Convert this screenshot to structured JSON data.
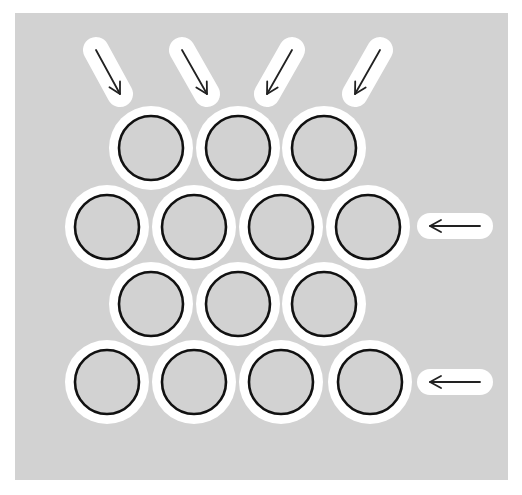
{
  "diagram": {
    "title": "",
    "colors": {
      "page": "#ffffff",
      "panel": "#d2d2d2",
      "halo": "#ffffff",
      "circle_fill": "#d2d2d2",
      "circle_stroke": "#111111",
      "arrow": "#222222"
    },
    "panel": {
      "x": 15,
      "y": 13,
      "w": 493,
      "h": 467
    },
    "circle": {
      "inner_r": 32,
      "halo_r": 42,
      "stroke_w": 2.6
    },
    "rows": [
      {
        "y": 148,
        "xs": [
          151,
          238,
          324
        ]
      },
      {
        "y": 227,
        "xs": [
          107,
          194,
          281,
          368
        ]
      },
      {
        "y": 304,
        "xs": [
          151,
          238,
          324
        ]
      },
      {
        "y": 382,
        "xs": [
          107,
          194,
          281,
          370
        ]
      }
    ],
    "arrows": [
      {
        "name": "arrow-top-1",
        "x1": 96,
        "y1": 50,
        "x2": 120,
        "y2": 94
      },
      {
        "name": "arrow-top-2",
        "x1": 182,
        "y1": 50,
        "x2": 207,
        "y2": 94
      },
      {
        "name": "arrow-top-3",
        "x1": 292,
        "y1": 50,
        "x2": 267,
        "y2": 94
      },
      {
        "name": "arrow-top-4",
        "x1": 380,
        "y1": 50,
        "x2": 355,
        "y2": 94
      },
      {
        "name": "arrow-right-row2",
        "x1": 480,
        "y1": 226,
        "x2": 430,
        "y2": 226
      },
      {
        "name": "arrow-right-row4",
        "x1": 480,
        "y1": 382,
        "x2": 430,
        "y2": 382
      }
    ]
  }
}
